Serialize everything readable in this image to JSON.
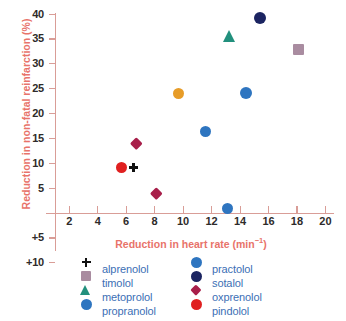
{
  "chart_data": {
    "type": "scatter",
    "title": "",
    "xlabel": "Reduction in heart rate (min⁻¹)",
    "ylabel": "Reduction in non-fatal reinfarction (%)",
    "xlim": [
      1,
      20.6
    ],
    "ylim": [
      -10,
      41
    ],
    "grid": false,
    "legend_position": "bottom",
    "xticks": [
      2,
      4,
      6,
      8,
      10,
      12,
      14,
      16,
      18,
      20
    ],
    "xtick_labels": [
      "2",
      "4",
      "6",
      "8",
      "10",
      "12",
      "14",
      "16",
      "18",
      "20"
    ],
    "yticks": [
      40,
      35,
      30,
      25,
      20,
      15,
      10,
      5,
      -5,
      -10
    ],
    "ytick_labels": [
      "40",
      "35",
      "30",
      "25",
      "20",
      "15",
      "10",
      "5",
      "+5",
      "+10"
    ],
    "points": [
      {
        "name": "sotalol",
        "x": 15.4,
        "y": 39.1,
        "marker": "circle",
        "color": "#1b2461",
        "size": 12
      },
      {
        "name": "metoprolol",
        "x": 13.3,
        "y": 35.4,
        "marker": "triangle",
        "color": "#22907d",
        "size": 13
      },
      {
        "name": "timolol",
        "x": 18.1,
        "y": 32.9,
        "marker": "square",
        "color": "#a98ca0",
        "size": 11
      },
      {
        "name": "unlabelled-orange",
        "x": 9.7,
        "y": 24.1,
        "marker": "circle",
        "color": "#e79c28",
        "size": 11
      },
      {
        "name": "practolol",
        "x": 14.4,
        "y": 24.1,
        "marker": "circle",
        "color": "#2e75c0",
        "size": 12
      },
      {
        "name": "propranolol",
        "x": 11.6,
        "y": 16.4,
        "marker": "circle",
        "color": "#2e75c0",
        "size": 11
      },
      {
        "name": "oxprenolol",
        "x": 6.7,
        "y": 14.1,
        "marker": "diamond",
        "color": "#a81f4a",
        "size": 11
      },
      {
        "name": "pindolol",
        "x": 5.7,
        "y": 9.1,
        "marker": "circle",
        "color": "#e02020",
        "size": 11
      },
      {
        "name": "alprenolol",
        "x": 6.5,
        "y": 9.2,
        "marker": "plus",
        "color": "#111111",
        "size": 9
      },
      {
        "name": "oxprenolol-2",
        "x": 8.1,
        "y": 3.9,
        "marker": "diamond",
        "color": "#a81f4a",
        "size": 11
      },
      {
        "name": "practolol-2",
        "x": 13.1,
        "y": 0.9,
        "marker": "circle",
        "color": "#2e75c0",
        "size": 11
      }
    ],
    "legend": [
      {
        "label": "alprenolol",
        "marker": "plus",
        "color": "#111111",
        "size": 9,
        "column": "left"
      },
      {
        "label": "timolol",
        "marker": "square",
        "color": "#a98ca0",
        "size": 10,
        "column": "left"
      },
      {
        "label": "metoprolol",
        "marker": "triangle",
        "color": "#22907d",
        "size": 11,
        "column": "left"
      },
      {
        "label": "propranolol",
        "marker": "circle",
        "color": "#2e75c0",
        "size": 11,
        "column": "left"
      },
      {
        "label": "practolol",
        "marker": "circle",
        "color": "#2e75c0",
        "size": 11,
        "column": "right"
      },
      {
        "label": "sotalol",
        "marker": "circle",
        "color": "#1b2461",
        "size": 11,
        "column": "right"
      },
      {
        "label": "oxprenolol",
        "marker": "diamond",
        "color": "#a81f4a",
        "size": 10,
        "column": "right"
      },
      {
        "label": "pindolol",
        "marker": "circle",
        "color": "#e02020",
        "size": 11,
        "column": "right"
      }
    ]
  },
  "colors": {
    "axis": "#d99d97",
    "axis_title": "#e8736a",
    "tick_label": "#2e2b2a",
    "legend_label": "#3c6fb5",
    "background": "#ffffff"
  }
}
